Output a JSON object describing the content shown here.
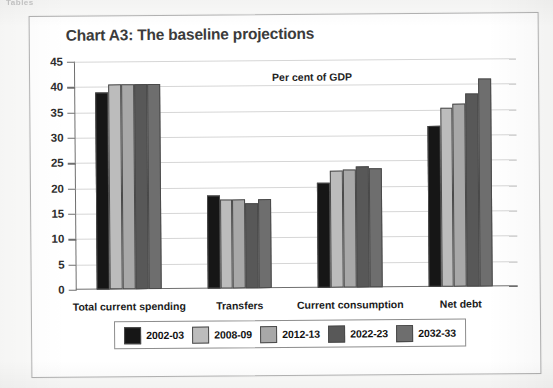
{
  "scan": {
    "top_cut_text": "Tables"
  },
  "chart_data": {
    "type": "bar",
    "title": "Chart A3: The baseline projections",
    "annotation": "Per cent of GDP",
    "xlabel": "",
    "ylabel": "",
    "ylim": [
      0,
      45
    ],
    "yticks": [
      0,
      5,
      10,
      15,
      20,
      25,
      30,
      35,
      40,
      45
    ],
    "grid": true,
    "legend_position": "bottom",
    "categories": [
      "Total current spending",
      "Transfers",
      "Current consumption",
      "Net debt"
    ],
    "series": [
      {
        "name": "2002-03",
        "color": "#161616",
        "values": [
          38.8,
          18.3,
          20.7,
          31.8
        ]
      },
      {
        "name": "2008-09",
        "color": "#bcbcbc",
        "values": [
          40.5,
          17.6,
          23.0,
          35.3
        ]
      },
      {
        "name": "2012-13",
        "color": "#a8a8a8",
        "values": [
          40.5,
          17.5,
          23.2,
          36.2
        ]
      },
      {
        "name": "2022-23",
        "color": "#585858",
        "values": [
          40.5,
          16.8,
          23.8,
          38.0
        ]
      },
      {
        "name": "2032-33",
        "color": "#6e6e6e",
        "values": [
          40.5,
          17.5,
          23.4,
          41.0
        ]
      }
    ]
  }
}
